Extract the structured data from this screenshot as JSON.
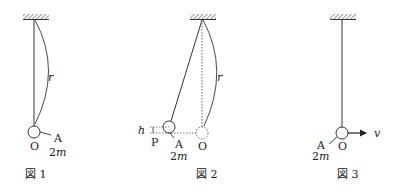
{
  "figures": [
    {
      "caption": "図 1",
      "labels": {
        "length": "r",
        "point": "O",
        "ball": "A",
        "mass": "2m"
      }
    },
    {
      "caption": "図 2",
      "labels": {
        "height": "h",
        "point_p": "P",
        "ball": "A",
        "mass": "2m",
        "point_o": "O",
        "length": "r"
      }
    },
    {
      "caption": "図 3",
      "labels": {
        "ball": "A",
        "mass": "2m",
        "point": "O",
        "velocity": "v"
      }
    }
  ],
  "colors": {
    "line": "#333333",
    "dotted": "#555555",
    "text": "#222222"
  }
}
